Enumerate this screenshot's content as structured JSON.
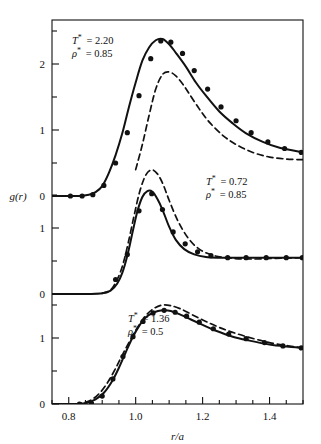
{
  "figure": {
    "name": "radial-distribution-function-figure",
    "background": "#ffffff",
    "ink": "#111111"
  },
  "axes": {
    "xlabel": "r/a",
    "ylabel": "g(r)",
    "x_ticklabels": [
      "0.8",
      "1.0",
      "1.2",
      "1.4"
    ],
    "x_tickvalues": [
      0.8,
      1.0,
      1.2,
      1.4
    ],
    "x_minor_step": 0.05,
    "xlim": [
      0.75,
      1.5
    ],
    "panel_top_ticklabels": [
      "0",
      "1",
      "2"
    ],
    "panel_mid_ticklabels": [
      "0",
      "1"
    ],
    "panel_bot_ticklabels": [
      "0",
      "1"
    ],
    "y_minor_step": 0.5,
    "grid": "off"
  },
  "annotations": {
    "top": {
      "temperature_label": "T* = 2.20",
      "density_label": "ρ* = 0.85",
      "t_symbol": "T",
      "t_star": "*",
      "t_value": "= 2.20",
      "rho_symbol": "ρ",
      "rho_star": "*",
      "rho_value": "= 0.85"
    },
    "middle": {
      "temperature_label": "T* = 0.72",
      "density_label": "ρ* = 0.85",
      "t_symbol": "T",
      "t_star": "*",
      "t_value": "= 0.72",
      "rho_symbol": "ρ",
      "rho_star": "*",
      "rho_value": "= 0.85"
    },
    "bottom": {
      "temperature_label": "T* = 1.36",
      "density_label": "ρ* = 0.5",
      "t_symbol": "T",
      "t_star": "*",
      "t_value": "= 1.36",
      "rho_symbol": "ρ",
      "rho_star": "*",
      "rho_value": "= 0.5"
    }
  },
  "chart_data": {
    "type": "line",
    "title": "",
    "xlabel": "r/a",
    "ylabel": "g(r)",
    "xlim": [
      0.75,
      1.5
    ],
    "grid": "off",
    "legend": "none",
    "panels": [
      {
        "id": "panel-top",
        "label_T": "T* = 2.20",
        "label_rho": "ρ* = 0.85",
        "ylim": [
          0,
          2.6
        ],
        "yticks": [
          0,
          1,
          2
        ],
        "series": [
          {
            "name": "solid-theory-curve",
            "style": "solid",
            "x": [
              0.75,
              0.8,
              0.83,
              0.86,
              0.88,
              0.9,
              0.92,
              0.94,
              0.96,
              0.98,
              1.0,
              1.02,
              1.04,
              1.06,
              1.08,
              1.1,
              1.12,
              1.15,
              1.18,
              1.21,
              1.25,
              1.29,
              1.33,
              1.38,
              1.43,
              1.5
            ],
            "y": [
              0.0,
              0.0,
              0.0,
              0.02,
              0.06,
              0.15,
              0.35,
              0.62,
              0.95,
              1.35,
              1.72,
              2.05,
              2.25,
              2.36,
              2.38,
              2.3,
              2.17,
              1.96,
              1.72,
              1.52,
              1.28,
              1.1,
              0.95,
              0.82,
              0.73,
              0.66
            ]
          },
          {
            "name": "dashed-curve",
            "style": "dashed",
            "x": [
              1.0,
              1.02,
              1.04,
              1.06,
              1.08,
              1.1,
              1.12,
              1.14,
              1.16,
              1.19,
              1.22,
              1.26,
              1.3,
              1.35,
              1.4,
              1.45,
              1.5
            ],
            "y": [
              0.4,
              0.78,
              1.22,
              1.62,
              1.84,
              1.88,
              1.82,
              1.7,
              1.55,
              1.32,
              1.12,
              0.92,
              0.78,
              0.66,
              0.59,
              0.56,
              0.55
            ]
          },
          {
            "name": "data-points",
            "style": "markers",
            "x": [
              0.805,
              0.84,
              0.872,
              0.905,
              0.94,
              0.975,
              1.01,
              1.045,
              1.075,
              1.105,
              1.14,
              1.175,
              1.215,
              1.255,
              1.3,
              1.345,
              1.395,
              1.445,
              1.495
            ],
            "y": [
              0.0,
              0.0,
              0.02,
              0.16,
              0.5,
              0.96,
              1.52,
              2.08,
              2.35,
              2.33,
              2.16,
              1.9,
              1.62,
              1.35,
              1.14,
              0.96,
              0.82,
              0.72,
              0.66
            ]
          }
        ]
      },
      {
        "id": "panel-middle",
        "label_T": "T* = 0.72",
        "label_rho": "ρ* = 0.85",
        "ylim": [
          0,
          1.8
        ],
        "yticks": [
          0,
          1
        ],
        "series": [
          {
            "name": "solid-theory-curve",
            "style": "solid",
            "x": [
              0.75,
              0.82,
              0.86,
              0.9,
              0.925,
              0.945,
              0.96,
              0.975,
              0.99,
              1.005,
              1.02,
              1.035,
              1.05,
              1.065,
              1.08,
              1.1,
              1.12,
              1.145,
              1.175,
              1.21,
              1.25,
              1.3,
              1.36,
              1.42,
              1.5
            ],
            "y": [
              0.0,
              0.0,
              0.0,
              0.01,
              0.05,
              0.16,
              0.32,
              0.58,
              0.92,
              1.25,
              1.47,
              1.56,
              1.55,
              1.44,
              1.28,
              1.02,
              0.82,
              0.68,
              0.6,
              0.56,
              0.55,
              0.55,
              0.55,
              0.55,
              0.55
            ]
          },
          {
            "name": "dashed-curve",
            "style": "dashed",
            "x": [
              0.9,
              0.925,
              0.945,
              0.962,
              0.978,
              0.995,
              1.012,
              1.03,
              1.048,
              1.065,
              1.082,
              1.1,
              1.125,
              1.155,
              1.19,
              1.235,
              1.29,
              1.35,
              1.42,
              1.5
            ],
            "y": [
              0.01,
              0.06,
              0.22,
              0.45,
              0.78,
              1.18,
              1.55,
              1.8,
              1.88,
              1.82,
              1.66,
              1.42,
              1.12,
              0.86,
              0.68,
              0.58,
              0.54,
              0.53,
              0.54,
              0.55
            ]
          },
          {
            "name": "data-points",
            "style": "markers",
            "x": [
              0.94,
              0.975,
              1.01,
              1.048,
              1.08,
              1.112,
              1.148,
              1.185,
              1.225,
              1.275,
              1.33,
              1.39,
              1.45,
              1.498
            ],
            "y": [
              0.22,
              0.6,
              1.26,
              1.52,
              1.28,
              0.94,
              0.76,
              0.64,
              0.58,
              0.55,
              0.55,
              0.55,
              0.55,
              0.55
            ]
          }
        ]
      },
      {
        "id": "panel-bottom",
        "label_T": "T* = 1.36",
        "label_rho": "ρ* = 0.5",
        "ylim": [
          0,
          1.6
        ],
        "yticks": [
          0,
          1
        ],
        "series": [
          {
            "name": "solid-theory-curve",
            "style": "solid",
            "x": [
              0.75,
              0.8,
              0.83,
              0.855,
              0.88,
              0.905,
              0.93,
              0.95,
              0.97,
              0.99,
              1.01,
              1.03,
              1.055,
              1.08,
              1.105,
              1.135,
              1.165,
              1.2,
              1.24,
              1.29,
              1.34,
              1.4,
              1.45,
              1.5
            ],
            "y": [
              0.0,
              0.0,
              0.0,
              0.02,
              0.07,
              0.17,
              0.35,
              0.55,
              0.78,
              1.0,
              1.18,
              1.31,
              1.39,
              1.42,
              1.41,
              1.35,
              1.28,
              1.2,
              1.11,
              1.02,
              0.96,
              0.9,
              0.87,
              0.85
            ]
          },
          {
            "name": "dashed-curve",
            "style": "dashed",
            "x": [
              0.82,
              0.845,
              0.87,
              0.895,
              0.918,
              0.94,
              0.962,
              0.985,
              1.008,
              1.03,
              1.055,
              1.08,
              1.105,
              1.135,
              1.17,
              1.21,
              1.255,
              1.305,
              1.36,
              1.42,
              1.5
            ],
            "y": [
              0.0,
              0.02,
              0.07,
              0.18,
              0.34,
              0.54,
              0.76,
              0.98,
              1.18,
              1.34,
              1.45,
              1.5,
              1.49,
              1.44,
              1.35,
              1.25,
              1.15,
              1.06,
              0.98,
              0.91,
              0.85
            ]
          },
          {
            "name": "data-points",
            "style": "markers",
            "x": [
              0.832,
              0.868,
              0.9,
              0.932,
              0.962,
              0.992,
              1.022,
              1.052,
              1.085,
              1.118,
              1.152,
              1.19,
              1.232,
              1.278,
              1.33,
              1.385,
              1.44,
              1.495
            ],
            "y": [
              0.0,
              0.01,
              0.12,
              0.38,
              0.72,
              1.02,
              1.25,
              1.38,
              1.42,
              1.39,
              1.33,
              1.24,
              1.14,
              1.06,
              0.99,
              0.93,
              0.88,
              0.85
            ]
          }
        ]
      }
    ]
  }
}
